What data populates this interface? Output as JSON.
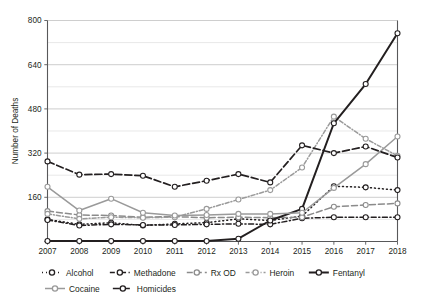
{
  "chart_data": {
    "type": "line",
    "title": "",
    "subtitle": "",
    "xlabel": "",
    "ylabel": "Number of Deaths",
    "x": [
      2007,
      2008,
      2009,
      2010,
      2011,
      2012,
      2013,
      2014,
      2015,
      2016,
      2017,
      2018
    ],
    "categories": [
      "2007",
      "2008",
      "2009",
      "2010",
      "2011",
      "2012",
      "2013",
      "2014",
      "2015",
      "2016",
      "2017",
      "2018"
    ],
    "xlim": [
      2007,
      2018
    ],
    "ylim": [
      0,
      800
    ],
    "yticks": [
      0,
      160,
      320,
      480,
      640,
      800
    ],
    "ytick_labels": [
      "",
      "160",
      "320",
      "480",
      "640",
      "800"
    ],
    "yminor_step": 80,
    "grid": "horizontal",
    "legend_position": "bottom",
    "series": [
      {
        "name": "Alcohol",
        "values": [
          80,
          62,
          68,
          58,
          64,
          68,
          82,
          76,
          92,
          200,
          196,
          186
        ],
        "color": "#231f20",
        "dash": "1,3",
        "width": 1.5
      },
      {
        "name": "Methadone",
        "values": [
          78,
          58,
          62,
          60,
          60,
          62,
          64,
          62,
          84,
          88,
          88,
          88
        ],
        "color": "#231f20",
        "dash": "5,2.5,1.2,2.5",
        "width": 1.5
      },
      {
        "name": "Rx OD",
        "values": [
          110,
          96,
          94,
          88,
          90,
          86,
          88,
          86,
          88,
          126,
          132,
          138
        ],
        "color": "#8b8b8b",
        "dash": "6,3",
        "width": 1.5
      },
      {
        "name": "Heroin",
        "values": [
          100,
          82,
          88,
          86,
          88,
          118,
          152,
          186,
          268,
          452,
          372,
          310
        ],
        "color": "#9a9a9a",
        "dash": "4,2,1,2",
        "width": 1.5
      },
      {
        "name": "Fentanyl",
        "values": [
          2,
          2,
          2,
          2,
          2,
          2,
          10,
          76,
          118,
          428,
          570,
          754
        ],
        "color": "#231f20",
        "dash": "none",
        "width": 2.0
      },
      {
        "name": "Cocaine",
        "values": [
          198,
          112,
          155,
          104,
          94,
          96,
          100,
          100,
          104,
          194,
          280,
          380
        ],
        "color": "#9a9a9a",
        "dash": "none",
        "width": 1.5
      },
      {
        "name": "Homicides",
        "values": [
          290,
          242,
          244,
          238,
          198,
          220,
          244,
          214,
          348,
          320,
          344,
          304
        ],
        "color": "#231f20",
        "dash": "7,3",
        "width": 1.7
      }
    ],
    "legend_rows": [
      [
        "Alcohol",
        "Methadone",
        "Rx OD",
        "Heroin",
        "Fentanyl"
      ],
      [
        "Cocaine",
        "Homicides"
      ]
    ]
  },
  "colors": {
    "background": "#ffffff",
    "text": "#231f20",
    "gridline_major": "#b9b9b9",
    "gridline_minor": "#d8d8d8",
    "axis": "#58585a"
  }
}
